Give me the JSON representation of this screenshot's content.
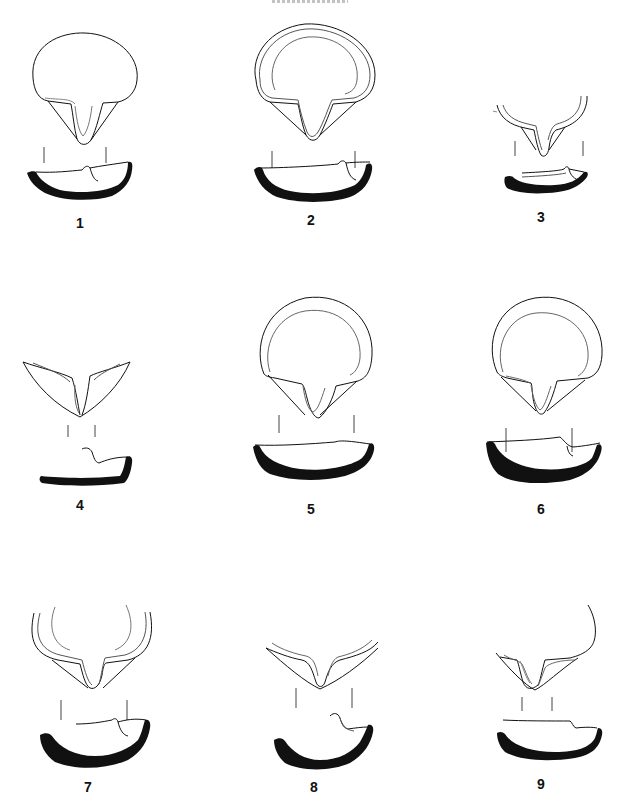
{
  "plate": {
    "header_text_visible": false,
    "figures": [
      {
        "number": "1",
        "label_x": 80,
        "label_y": 216
      },
      {
        "number": "2",
        "label_x": 311,
        "label_y": 213
      },
      {
        "number": "3",
        "label_x": 541,
        "label_y": 210
      },
      {
        "number": "4",
        "label_x": 80,
        "label_y": 498
      },
      {
        "number": "5",
        "label_x": 311,
        "label_y": 502
      },
      {
        "number": "6",
        "label_x": 541,
        "label_y": 502
      },
      {
        "number": "7",
        "label_x": 88,
        "label_y": 780
      },
      {
        "number": "8",
        "label_x": 314,
        "label_y": 780
      },
      {
        "number": "9",
        "label_x": 541,
        "label_y": 777
      }
    ]
  },
  "colors": {
    "ink": "#111111",
    "paper": "#ffffff",
    "light_line": "#555555"
  }
}
